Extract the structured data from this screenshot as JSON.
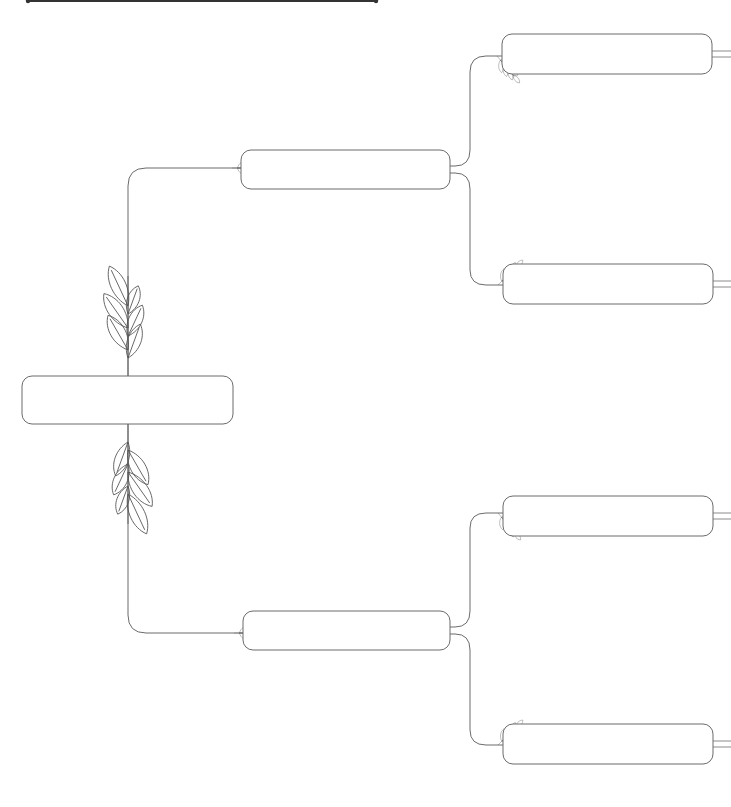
{
  "page": {
    "width": 731,
    "height": 807,
    "background": "#ffffff"
  },
  "colors": {
    "stroke": "#6b6b6b",
    "title_line": "#333333",
    "leaf": "#555555"
  },
  "title_line": {
    "x1": 28,
    "x2": 376,
    "y": 0
  },
  "boxes": [
    {
      "id": "root",
      "label": "",
      "x": 22,
      "y": 376,
      "w": 211,
      "h": 48,
      "r": 10
    },
    {
      "id": "parent-top",
      "label": "",
      "x": 241,
      "y": 150,
      "w": 209,
      "h": 39,
      "r": 10
    },
    {
      "id": "parent-bottom",
      "label": "",
      "x": 243,
      "y": 611,
      "w": 207,
      "h": 39,
      "r": 10
    },
    {
      "id": "grandparent-1",
      "label": "",
      "x": 502,
      "y": 34,
      "w": 210,
      "h": 40,
      "r": 10
    },
    {
      "id": "grandparent-2",
      "label": "",
      "x": 503,
      "y": 264,
      "w": 210,
      "h": 40,
      "r": 10
    },
    {
      "id": "grandparent-3",
      "label": "",
      "x": 503,
      "y": 496,
      "w": 210,
      "h": 40,
      "r": 10
    },
    {
      "id": "grandparent-4",
      "label": "",
      "x": 503,
      "y": 724,
      "w": 210,
      "h": 40,
      "r": 10
    }
  ],
  "connectors": [
    {
      "id": "root-to-parent-top",
      "d": "M128 376 L128 186 Q128 168 146 168 L241 168"
    },
    {
      "id": "root-to-parent-bottom",
      "d": "M128 424 L128 615 Q128 633 146 633 L243 633"
    },
    {
      "id": "pt-to-gp1",
      "d": "M450 166 L455 166 Q470 166 470 150 L470 72 Q470 56 486 56 L502 56"
    },
    {
      "id": "pt-to-gp2",
      "d": "M450 173 L455 173 Q470 173 470 189 L470 270 Q470 285 486 285 L503 285"
    },
    {
      "id": "pb-to-gp3",
      "d": "M450 627 L455 627 Q470 627 470 611 L470 528 Q470 513 486 513 L503 513"
    },
    {
      "id": "pb-to-gp4",
      "d": "M450 634 L455 634 Q470 634 470 650 L470 730 Q470 745 486 745 L503 745"
    }
  ],
  "stubs": [
    {
      "x1": 712,
      "x2": 731,
      "y1": 51,
      "y2": 57
    },
    {
      "x1": 713,
      "x2": 731,
      "y1": 281,
      "y2": 287
    },
    {
      "x1": 713,
      "x2": 731,
      "y1": 513,
      "y2": 519
    },
    {
      "x1": 713,
      "x2": 731,
      "y1": 741,
      "y2": 747
    }
  ],
  "ornaments": [
    {
      "id": "big-leaf-up",
      "x": 128,
      "y": 376,
      "rot": 0,
      "scale": 1.0,
      "type": "large-branch",
      "flip": false
    },
    {
      "id": "big-leaf-down",
      "x": 128,
      "y": 424,
      "rot": 180,
      "scale": 1.0,
      "type": "large-branch",
      "flip": true
    },
    {
      "id": "sprig-pt",
      "x": 232,
      "y": 168,
      "rot": -90,
      "scale": 0.45,
      "type": "sprig"
    },
    {
      "id": "sprig-pb",
      "x": 234,
      "y": 633,
      "rot": -90,
      "scale": 0.45,
      "type": "sprig"
    },
    {
      "id": "sprig-gp1",
      "x": 497,
      "y": 56,
      "rot": -40,
      "scale": 0.45,
      "type": "sprig"
    },
    {
      "id": "sprig-gp2",
      "x": 498,
      "y": 285,
      "rot": -135,
      "scale": 0.45,
      "type": "sprig"
    },
    {
      "id": "sprig-gp3",
      "x": 498,
      "y": 513,
      "rot": -40,
      "scale": 0.45,
      "type": "sprig"
    },
    {
      "id": "sprig-gp4",
      "x": 498,
      "y": 745,
      "rot": -135,
      "scale": 0.45,
      "type": "sprig"
    }
  ]
}
